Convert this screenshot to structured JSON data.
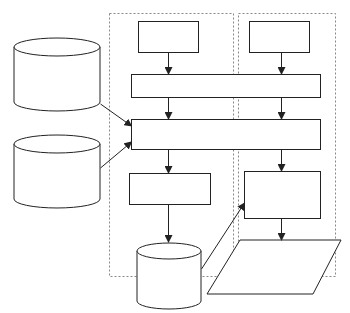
{
  "diagram": {
    "width": 350,
    "height": 313,
    "stroke": "#222222",
    "dashed_stroke": "#888888",
    "fill": "#ffffff",
    "containers": [
      {
        "id": "left-lane",
        "x": 109,
        "y": 13,
        "w": 124,
        "h": 263
      },
      {
        "id": "right-lane",
        "x": 238,
        "y": 13,
        "w": 97,
        "h": 263
      }
    ],
    "boxes": [
      {
        "id": "top-left-box",
        "x": 138,
        "y": 21,
        "w": 60,
        "h": 31
      },
      {
        "id": "top-right-box",
        "x": 249,
        "y": 21,
        "w": 60,
        "h": 31
      },
      {
        "id": "wide-box-1",
        "x": 131,
        "y": 74,
        "w": 189,
        "h": 23
      },
      {
        "id": "wide-box-2",
        "x": 131,
        "y": 119,
        "w": 189,
        "h": 30
      },
      {
        "id": "lower-left-box",
        "x": 129,
        "y": 173,
        "w": 81,
        "h": 31
      },
      {
        "id": "lower-right-box",
        "x": 244,
        "y": 171,
        "w": 76,
        "h": 47
      }
    ],
    "cylinders": [
      {
        "id": "db-left-top",
        "cx": 57,
        "top": 38,
        "rx": 43,
        "ry": 9,
        "h": 55
      },
      {
        "id": "db-left-bottom",
        "cx": 57,
        "top": 135,
        "rx": 43,
        "ry": 9,
        "h": 55
      },
      {
        "id": "db-bottom",
        "cx": 169,
        "top": 243,
        "rx": 32,
        "ry": 8,
        "h": 50
      }
    ],
    "parallelograms": [
      {
        "id": "output-parallelogram",
        "points": "240,240 341,240 313,294 207,294"
      }
    ],
    "arrows": [
      {
        "id": "a1",
        "x1": 168,
        "y1": 52,
        "x2": 168,
        "y2": 74
      },
      {
        "id": "a2",
        "x1": 281,
        "y1": 52,
        "x2": 281,
        "y2": 74
      },
      {
        "id": "a3",
        "x1": 168,
        "y1": 97,
        "x2": 168,
        "y2": 119
      },
      {
        "id": "a4",
        "x1": 281,
        "y1": 97,
        "x2": 281,
        "y2": 119
      },
      {
        "id": "a5",
        "x1": 100,
        "y1": 104,
        "x2": 131,
        "y2": 126
      },
      {
        "id": "a6",
        "x1": 100,
        "y1": 168,
        "x2": 131,
        "y2": 142
      },
      {
        "id": "a7",
        "x1": 168,
        "y1": 149,
        "x2": 168,
        "y2": 173
      },
      {
        "id": "a8",
        "x1": 281,
        "y1": 149,
        "x2": 281,
        "y2": 171
      },
      {
        "id": "a9",
        "x1": 168,
        "y1": 204,
        "x2": 168,
        "y2": 242
      },
      {
        "id": "a10",
        "x1": 201,
        "y1": 269,
        "x2": 244,
        "y2": 203
      },
      {
        "id": "a11",
        "x1": 281,
        "y1": 218,
        "x2": 281,
        "y2": 240
      }
    ]
  }
}
